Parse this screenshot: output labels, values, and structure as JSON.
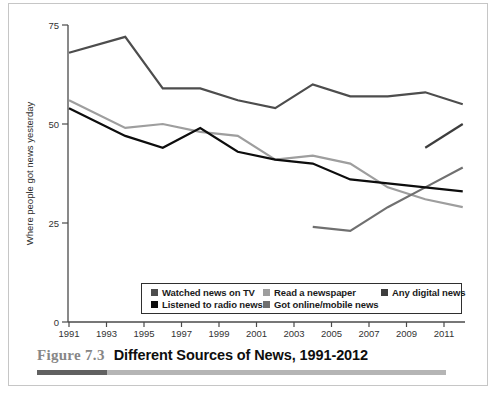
{
  "figure": {
    "label": "Figure 7.3",
    "title": "Different Sources of News, 1991-2012"
  },
  "chart_data": {
    "type": "line",
    "title": "Different Sources of News, 1991-2012",
    "xlabel": "",
    "ylabel": "Where people got news yesterday",
    "ylim": [
      0,
      75
    ],
    "xlim": [
      1991,
      2012
    ],
    "y_ticks": [
      0,
      25,
      50,
      75
    ],
    "x_ticks": [
      1991,
      1993,
      1995,
      1997,
      1999,
      2001,
      2003,
      2005,
      2007,
      2009,
      2011
    ],
    "grid": "off",
    "legend_position": "bottom-inside",
    "draw_order": [
      1,
      4,
      3,
      0,
      2
    ],
    "series": [
      {
        "name": "Watched news on TV",
        "color": "#4d4d4d",
        "points": [
          [
            1991,
            68
          ],
          [
            1994,
            72
          ],
          [
            1996,
            59
          ],
          [
            1998,
            59
          ],
          [
            2000,
            56
          ],
          [
            2002,
            54
          ],
          [
            2004,
            60
          ],
          [
            2006,
            57
          ],
          [
            2008,
            57
          ],
          [
            2010,
            58
          ],
          [
            2012,
            55
          ]
        ]
      },
      {
        "name": "Read a newspaper",
        "color": "#9e9e9e",
        "points": [
          [
            1991,
            56
          ],
          [
            1994,
            49
          ],
          [
            1996,
            50
          ],
          [
            1998,
            48
          ],
          [
            2000,
            47
          ],
          [
            2002,
            41
          ],
          [
            2004,
            42
          ],
          [
            2006,
            40
          ],
          [
            2008,
            34
          ],
          [
            2010,
            31
          ],
          [
            2012,
            29
          ]
        ]
      },
      {
        "name": "Any digital news",
        "color": "#3d3d3d",
        "points": [
          [
            2010,
            44
          ],
          [
            2012,
            50
          ]
        ]
      },
      {
        "name": "Listened to radio news",
        "color": "#0d0d0d",
        "points": [
          [
            1991,
            54
          ],
          [
            1994,
            47
          ],
          [
            1996,
            44
          ],
          [
            1998,
            49
          ],
          [
            2000,
            43
          ],
          [
            2002,
            41
          ],
          [
            2004,
            40
          ],
          [
            2006,
            36
          ],
          [
            2008,
            35
          ],
          [
            2010,
            34
          ],
          [
            2012,
            33
          ]
        ]
      },
      {
        "name": "Got online/mobile news",
        "color": "#707070",
        "points": [
          [
            2004,
            24
          ],
          [
            2006,
            23
          ],
          [
            2008,
            29
          ],
          [
            2010,
            34
          ],
          [
            2012,
            39
          ]
        ]
      }
    ]
  }
}
